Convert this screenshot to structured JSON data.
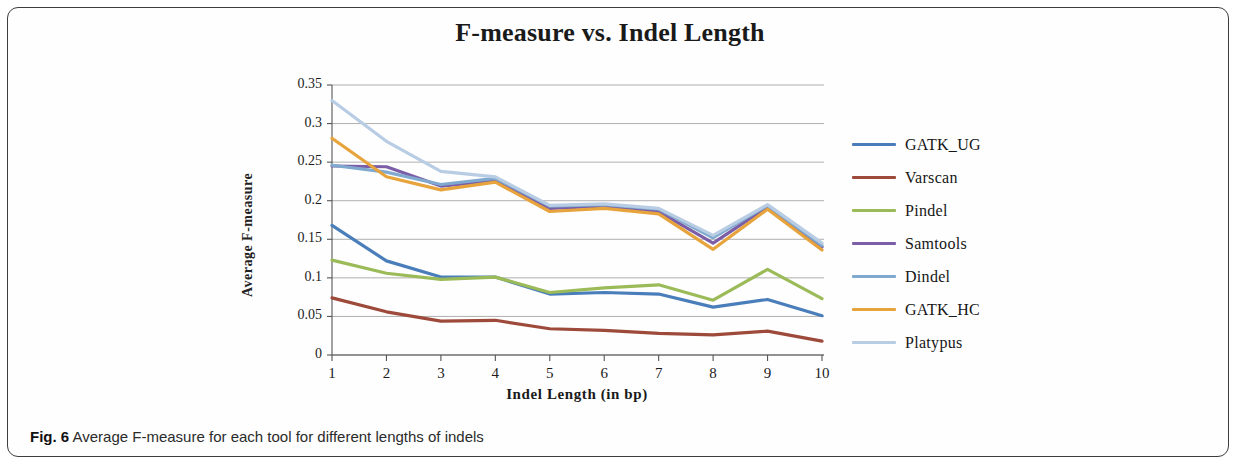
{
  "figure": {
    "caption_label": "Fig. 6",
    "caption_text": "Average F-measure for each tool for different lengths of indels"
  },
  "chart_data": {
    "type": "line",
    "title": "F-measure vs. Indel Length",
    "xlabel": "Indel Length (in bp)",
    "ylabel": "Average F-measure",
    "x": [
      1,
      2,
      3,
      4,
      5,
      6,
      7,
      8,
      9,
      10
    ],
    "categories": [
      "1",
      "2",
      "3",
      "4",
      "5",
      "6",
      "7",
      "8",
      "9",
      "10"
    ],
    "xlim": [
      1,
      10
    ],
    "ylim": [
      0,
      0.35
    ],
    "yticks": [
      0,
      0.05,
      0.1,
      0.15,
      0.2,
      0.25,
      0.3,
      0.35
    ],
    "ytick_labels": [
      "0",
      "0.05",
      "0.1",
      "0.15",
      "0.2",
      "0.25",
      "0.3",
      "0.35"
    ],
    "grid": "horizontal",
    "legend_position": "right",
    "series": [
      {
        "name": "GATK_UG",
        "color": "#4a7EBB",
        "values": [
          0.168,
          0.122,
          0.101,
          0.101,
          0.079,
          0.081,
          0.079,
          0.062,
          0.072,
          0.051
        ]
      },
      {
        "name": "Varscan",
        "color": "#9E4A3A",
        "values": [
          0.074,
          0.056,
          0.044,
          0.045,
          0.034,
          0.032,
          0.028,
          0.026,
          0.031,
          0.018
        ]
      },
      {
        "name": "Pindel",
        "color": "#9BBB59",
        "values": [
          0.123,
          0.106,
          0.098,
          0.101,
          0.081,
          0.087,
          0.091,
          0.071,
          0.111,
          0.073
        ]
      },
      {
        "name": "Samtools",
        "color": "#7B5EA7",
        "values": [
          0.245,
          0.244,
          0.219,
          0.226,
          0.19,
          0.193,
          0.186,
          0.145,
          0.192,
          0.14
        ]
      },
      {
        "name": "Dindel",
        "color": "#7FA9CE",
        "values": [
          0.246,
          0.237,
          0.221,
          0.229,
          0.193,
          0.195,
          0.189,
          0.152,
          0.194,
          0.142
        ]
      },
      {
        "name": "GATK_HC",
        "color": "#E7A33C",
        "values": [
          0.281,
          0.231,
          0.214,
          0.224,
          0.186,
          0.19,
          0.183,
          0.137,
          0.189,
          0.136
        ]
      },
      {
        "name": "Platypus",
        "color": "#B8CCE4",
        "values": [
          0.33,
          0.277,
          0.238,
          0.231,
          0.194,
          0.196,
          0.19,
          0.155,
          0.195,
          0.145
        ]
      }
    ]
  }
}
